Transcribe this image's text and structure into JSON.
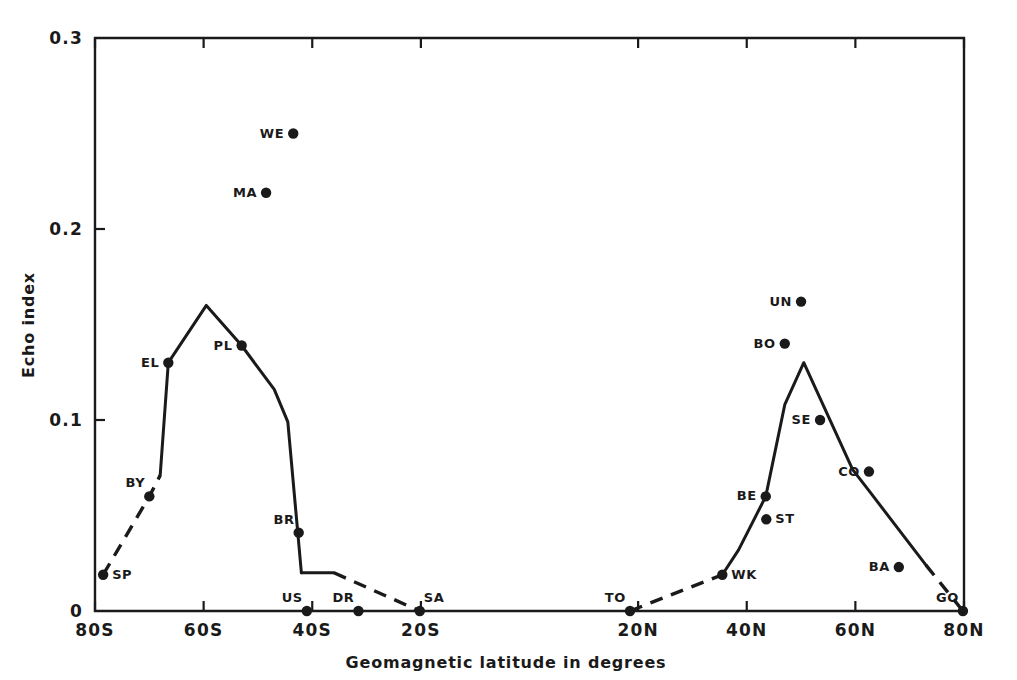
{
  "chart_data": {
    "type": "scatter",
    "title": "",
    "xlabel": "Geomagnetic  latitude in degrees",
    "ylabel": "Echo index",
    "xlim": [
      -80,
      80
    ],
    "ylim": [
      0,
      0.3
    ],
    "grid": false,
    "legend": "none",
    "x_tick_labels": [
      "80S",
      "60S",
      "40S",
      "20S",
      "20N",
      "40N",
      "60N",
      "80N"
    ],
    "x_tick_values": [
      -80,
      -60,
      -40,
      -20,
      20,
      40,
      60,
      80
    ],
    "y_tick_labels": [
      "0",
      "0.1",
      "0.2",
      "0.3"
    ],
    "y_tick_values": [
      0,
      0.1,
      0.2,
      0.3
    ],
    "points": [
      {
        "label": "SP",
        "x": -78.5,
        "y": 0.019,
        "label_side": "right"
      },
      {
        "label": "BY",
        "x": -70.0,
        "y": 0.06,
        "label_side": "above-left"
      },
      {
        "label": "EL",
        "x": -66.5,
        "y": 0.13,
        "label_side": "left"
      },
      {
        "label": "MA",
        "x": -48.5,
        "y": 0.219,
        "label_side": "left"
      },
      {
        "label": "WE",
        "x": -43.5,
        "y": 0.25,
        "label_side": "left"
      },
      {
        "label": "PL",
        "x": -53.0,
        "y": 0.139,
        "label_side": "left"
      },
      {
        "label": "BR",
        "x": -42.5,
        "y": 0.041,
        "label_side": "above-left"
      },
      {
        "label": "US",
        "x": -41.0,
        "y": 0.0,
        "label_side": "above-left"
      },
      {
        "label": "DR",
        "x": -31.5,
        "y": 0.0,
        "label_side": "above-left"
      },
      {
        "label": "SA",
        "x": -20.2,
        "y": 0.0,
        "label_side": "above-right"
      },
      {
        "label": "TO",
        "x": 18.5,
        "y": 0.0,
        "label_side": "above-left"
      },
      {
        "label": "WK",
        "x": 35.5,
        "y": 0.019,
        "label_side": "right"
      },
      {
        "label": "BE",
        "x": 43.5,
        "y": 0.06,
        "label_side": "left"
      },
      {
        "label": "ST",
        "x": 43.6,
        "y": 0.048,
        "label_side": "right"
      },
      {
        "label": "BO",
        "x": 47.0,
        "y": 0.14,
        "label_side": "left"
      },
      {
        "label": "UN",
        "x": 50.0,
        "y": 0.162,
        "label_side": "left"
      },
      {
        "label": "SE",
        "x": 53.5,
        "y": 0.1,
        "label_side": "left"
      },
      {
        "label": "CO",
        "x": 62.5,
        "y": 0.073,
        "label_side": "left"
      },
      {
        "label": "BA",
        "x": 68.0,
        "y": 0.023,
        "label_side": "left"
      },
      {
        "label": "GO",
        "x": 79.8,
        "y": 0.0,
        "label_side": "above-left"
      }
    ],
    "series": [
      {
        "name": "southern-dashed-lead",
        "style": "dashed",
        "x": [
          -78.5,
          -70.0,
          -68.0
        ],
        "y": [
          0.019,
          0.06,
          0.071
        ]
      },
      {
        "name": "southern-solid",
        "style": "solid",
        "x": [
          -68.0,
          -66.5,
          -59.5,
          -53.0,
          -47.0,
          -44.5,
          -42.0
        ],
        "y": [
          0.071,
          0.13,
          0.16,
          0.139,
          0.116,
          0.099,
          0.02
        ]
      },
      {
        "name": "southern-plateau",
        "style": "solid",
        "x": [
          -42.0,
          -36.0
        ],
        "y": [
          0.02,
          0.02
        ]
      },
      {
        "name": "southern-dashed-tail",
        "style": "dashed",
        "x": [
          -36.0,
          -20.2
        ],
        "y": [
          0.02,
          0.0
        ]
      },
      {
        "name": "northern-dashed-lead",
        "style": "dashed",
        "x": [
          18.5,
          35.5
        ],
        "y": [
          0.0,
          0.019
        ]
      },
      {
        "name": "northern-solid",
        "style": "solid",
        "x": [
          35.5,
          38.5,
          43.5,
          47.0,
          50.5,
          55.0,
          59.5,
          62.5,
          73.0
        ],
        "y": [
          0.019,
          0.032,
          0.06,
          0.108,
          0.13,
          0.102,
          0.074,
          0.063,
          0.024
        ]
      },
      {
        "name": "northern-dashed-tail",
        "style": "dashed",
        "x": [
          73.0,
          79.8
        ],
        "y": [
          0.024,
          0.0
        ]
      }
    ]
  }
}
